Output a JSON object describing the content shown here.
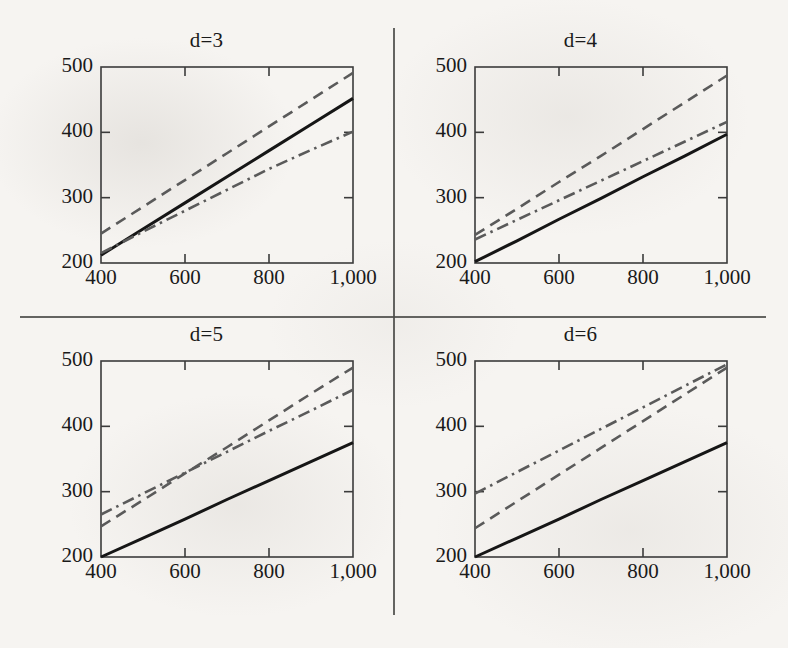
{
  "figure": {
    "background_color": "#f6f4f1",
    "ink_color": "#1a1a1a",
    "series_gray": "#5a5a5a",
    "layout": "2x2 grid of line panels separated by a vertical and a horizontal rule"
  },
  "chart_data": [
    {
      "type": "line",
      "title": "d=3",
      "xlabel": "",
      "ylabel": "",
      "xlim": [
        400,
        1000
      ],
      "ylim": [
        200,
        500
      ],
      "xticks": [
        400,
        600,
        800,
        1000
      ],
      "xticklabels": [
        "400",
        "600",
        "800",
        "1,000"
      ],
      "yticks": [
        200,
        300,
        400,
        500
      ],
      "yticklabels": [
        "200",
        "300",
        "400",
        "500"
      ],
      "grid": false,
      "legend": "none",
      "x": [
        400,
        500,
        600,
        700,
        800,
        900,
        1000
      ],
      "series": [
        {
          "name": "solid",
          "style": "solid",
          "color": "#161616",
          "values": [
            212,
            252,
            292,
            332,
            372,
            412,
            452
          ]
        },
        {
          "name": "dashed",
          "style": "dashed",
          "color": "#5a5a5a",
          "values": [
            245,
            286,
            327,
            368,
            409,
            450,
            491
          ]
        },
        {
          "name": "dash-dot",
          "style": "dash-dot",
          "color": "#5a5a5a",
          "values": [
            215,
            248,
            280,
            312,
            344,
            373,
            401
          ]
        }
      ]
    },
    {
      "type": "line",
      "title": "d=4",
      "xlabel": "",
      "ylabel": "",
      "xlim": [
        400,
        1000
      ],
      "ylim": [
        200,
        500
      ],
      "xticks": [
        400,
        600,
        800,
        1000
      ],
      "xticklabels": [
        "400",
        "600",
        "800",
        "1,000"
      ],
      "yticks": [
        200,
        300,
        400,
        500
      ],
      "yticklabels": [
        "200",
        "300",
        "400",
        "500"
      ],
      "grid": false,
      "legend": "none",
      "x": [
        400,
        500,
        600,
        700,
        800,
        900,
        1000
      ],
      "series": [
        {
          "name": "solid",
          "style": "solid",
          "color": "#161616",
          "values": [
            202,
            234,
            267,
            299,
            332,
            364,
            397
          ]
        },
        {
          "name": "dashed",
          "style": "dashed",
          "color": "#5a5a5a",
          "values": [
            243,
            283,
            324,
            364,
            405,
            446,
            487
          ]
        },
        {
          "name": "dash-dot",
          "style": "dash-dot",
          "color": "#5a5a5a",
          "values": [
            236,
            266,
            296,
            326,
            356,
            386,
            416
          ]
        }
      ]
    },
    {
      "type": "line",
      "title": "d=5",
      "xlabel": "",
      "ylabel": "",
      "xlim": [
        400,
        1000
      ],
      "ylim": [
        200,
        500
      ],
      "xticks": [
        400,
        600,
        800,
        1000
      ],
      "xticklabels": [
        "400",
        "600",
        "800",
        "1,000"
      ],
      "yticks": [
        200,
        300,
        400,
        500
      ],
      "yticklabels": [
        "200",
        "300",
        "400",
        "500"
      ],
      "grid": false,
      "legend": "none",
      "x": [
        400,
        500,
        600,
        700,
        800,
        900,
        1000
      ],
      "series": [
        {
          "name": "solid",
          "style": "solid",
          "color": "#161616",
          "values": [
            200,
            229,
            258,
            288,
            317,
            346,
            375
          ]
        },
        {
          "name": "dashed",
          "style": "dashed",
          "color": "#5a5a5a",
          "values": [
            247,
            287,
            328,
            368,
            409,
            450,
            490
          ]
        },
        {
          "name": "dash-dot",
          "style": "dash-dot",
          "color": "#5a5a5a",
          "values": [
            265,
            297,
            329,
            361,
            393,
            424,
            456
          ]
        }
      ]
    },
    {
      "type": "line",
      "title": "d=6",
      "xlabel": "",
      "ylabel": "",
      "xlim": [
        400,
        1000
      ],
      "ylim": [
        200,
        500
      ],
      "xticks": [
        400,
        600,
        800,
        1000
      ],
      "xticklabels": [
        "400",
        "600",
        "800",
        "1,000"
      ],
      "yticks": [
        200,
        300,
        400,
        500
      ],
      "yticklabels": [
        "200",
        "300",
        "400",
        "500"
      ],
      "grid": false,
      "legend": "none",
      "x": [
        400,
        500,
        600,
        700,
        800,
        900,
        1000
      ],
      "series": [
        {
          "name": "solid",
          "style": "solid",
          "color": "#161616",
          "values": [
            200,
            229,
            258,
            288,
            317,
            346,
            375
          ]
        },
        {
          "name": "dashed",
          "style": "dashed",
          "color": "#5a5a5a",
          "values": [
            244,
            285,
            326,
            367,
            408,
            449,
            490
          ]
        },
        {
          "name": "dash-dot",
          "style": "dash-dot",
          "color": "#5a5a5a",
          "values": [
            297,
            330,
            363,
            396,
            429,
            462,
            495
          ]
        }
      ]
    }
  ]
}
